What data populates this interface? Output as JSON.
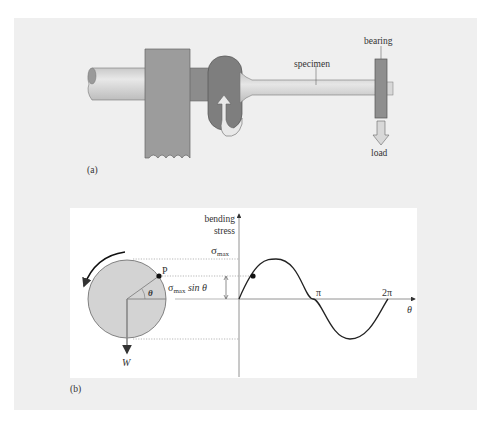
{
  "figure": {
    "panel_a": {
      "label": "(a)",
      "callouts": {
        "specimen": "specimen",
        "bearing": "bearing",
        "load": "load"
      }
    },
    "panel_b": {
      "label": "(b)",
      "y_axis_label_line1": "bending",
      "y_axis_label_line2": "stress",
      "sigma_max": "σ",
      "sigma_max_sub": "max",
      "sigma_sin_prefix": "σ",
      "sigma_sin_sub": "max",
      "sigma_sin_suffix": " sin θ",
      "point_label": "P",
      "angle_label": "θ",
      "weight_label": "W",
      "x_axis_label": "θ",
      "tick_pi": "π",
      "tick_2pi": "2π"
    },
    "colors": {
      "background": "#efefef",
      "panel": "#ffffff",
      "shaft": "#d6d6d6",
      "clamp": "#9a9a9a",
      "grip": "#7d7d7d",
      "circle": "#d4d4d4",
      "curve": "#222222"
    }
  }
}
